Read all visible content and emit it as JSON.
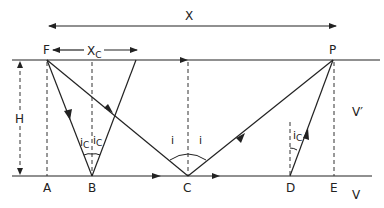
{
  "diagram": {
    "labels": {
      "X": "X",
      "Xc": "X",
      "Xc_sub": "C",
      "H": "H",
      "F": "F",
      "P": "P",
      "A": "A",
      "B": "B",
      "C": "C",
      "D": "D",
      "E": "E",
      "V_upper": "V′",
      "V_lower": "V",
      "i_left": "i",
      "i_right": "i",
      "ic_B_left": "i",
      "ic_B_right": "i",
      "ic_D": "i",
      "ic_sub": "C"
    },
    "points": [
      "F",
      "P",
      "A",
      "B",
      "C",
      "D",
      "E"
    ],
    "rays": [
      {
        "from": "F",
        "to": "B",
        "type": "critical-incidence"
      },
      {
        "from": "B",
        "to": "top-surface",
        "type": "critical-reflection"
      },
      {
        "from": "F",
        "to": "C",
        "type": "reflection-incident"
      },
      {
        "from": "C",
        "to": "P",
        "type": "reflection"
      },
      {
        "from": "D",
        "to": "P",
        "type": "head-wave"
      }
    ],
    "colors": {
      "ink": "#222222",
      "background": "#ffffff"
    }
  }
}
